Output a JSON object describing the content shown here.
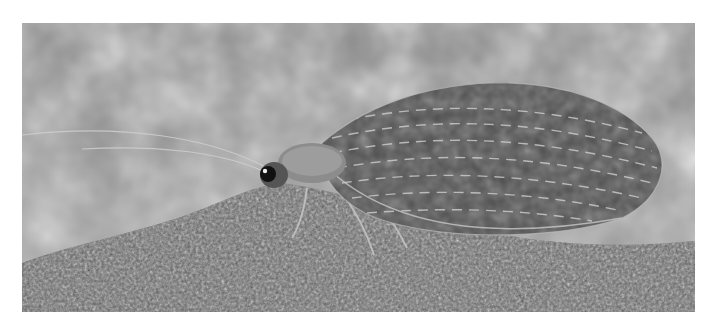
{
  "image": {
    "subject": "lacewing insect on rock",
    "style": "grayscale macro photograph",
    "frame": {
      "left": 22,
      "top": 23,
      "width": 673,
      "height": 289
    },
    "colors": {
      "page_background": "#ffffff",
      "background_blur": "#9a9a9a",
      "substrate": "#6e6e6e",
      "wing": "#5a5a5a",
      "wing_veins": "#d8d8d8",
      "eye": "#111111"
    }
  }
}
